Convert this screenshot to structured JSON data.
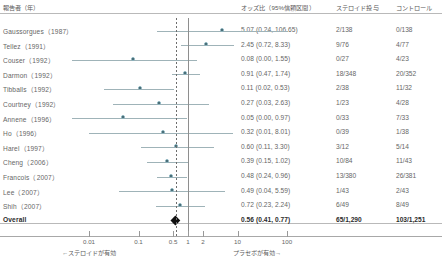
{
  "header": {
    "studies": "報告者（年）",
    "odds_ratio": "オッズ比（95%信頼区間）",
    "steroid": "ステロイド投与",
    "control": "コントロール"
  },
  "axis": {
    "ticks": [
      "0.01",
      "0.1",
      "0.5",
      "1",
      "2",
      "10",
      "100"
    ],
    "tick_values": [
      0.01,
      0.1,
      0.5,
      1,
      2,
      10,
      100
    ],
    "left_caption": "←ステロイドが有効",
    "right_caption": "プラセボが有効→",
    "null_value": 1
  },
  "colors": {
    "marker": "#2f4f57",
    "ci_line": "#9fb3b8",
    "diamond": "#111111",
    "null_line": "#8e8e8e",
    "summary_line": "#6d6d6d",
    "text": "#666666",
    "rule": "#b9b9b9"
  },
  "chart_data": {
    "type": "forest",
    "title": "",
    "xlabel": "オッズ比（95%信頼区間）",
    "ylabel": "",
    "scale": "log",
    "xlim": [
      0.004,
      300
    ],
    "grid": false,
    "null_line": 1,
    "summary_line": 0.56,
    "columns": [
      "報告者（年）",
      "オッズ比（95%信頼区間）",
      "ステロイド投与",
      "コントロール"
    ],
    "rows": [
      {
        "study": "Gaussorgues（1987）",
        "or": 5.07,
        "lo": 0.24,
        "hi": 106.65,
        "or_text": "5.07 (0.24, 106.65)",
        "steroid": "2/138",
        "control": "0/138",
        "bold": false
      },
      {
        "study": "Tellez（1991）",
        "or": 2.45,
        "lo": 0.72,
        "hi": 8.33,
        "or_text": "2.45 (0.72, 8.33)",
        "steroid": "9/76",
        "control": "4/77",
        "bold": false
      },
      {
        "study": "Couser（1992）",
        "or": 0.08,
        "lo": 0.0,
        "hi": 1.55,
        "or_text": "0.08 (0.00, 1.55)",
        "steroid": "0/27",
        "control": "4/23",
        "bold": false
      },
      {
        "study": "Darmon（1992）",
        "or": 0.91,
        "lo": 0.47,
        "hi": 1.74,
        "or_text": "0.91 (0.47, 1.74)",
        "steroid": "18/348",
        "control": "20/352",
        "bold": false
      },
      {
        "study": "Tibballs（1992）",
        "or": 0.11,
        "lo": 0.02,
        "hi": 0.53,
        "or_text": "0.11 (0.02, 0.53)",
        "steroid": "2/38",
        "control": "11/32",
        "bold": false
      },
      {
        "study": "Courtney（1992）",
        "or": 0.27,
        "lo": 0.03,
        "hi": 2.63,
        "or_text": "0.27 (0.03, 2.63)",
        "steroid": "1/23",
        "control": "4/28",
        "bold": false
      },
      {
        "study": "Annene（1996）",
        "or": 0.05,
        "lo": 0.0,
        "hi": 0.97,
        "or_text": "0.05 (0.00, 0.97)",
        "steroid": "0/33",
        "control": "7/33",
        "bold": false
      },
      {
        "study": "Ho（1996）",
        "or": 0.32,
        "lo": 0.01,
        "hi": 8.01,
        "or_text": "0.32 (0.01, 8.01)",
        "steroid": "0/39",
        "control": "1/38",
        "bold": false
      },
      {
        "study": "Harel（1997）",
        "or": 0.6,
        "lo": 0.11,
        "hi": 3.3,
        "or_text": "0.60 (0.11, 3.30)",
        "steroid": "3/12",
        "control": "5/14",
        "bold": false
      },
      {
        "study": "Cheng（2006）",
        "or": 0.39,
        "lo": 0.15,
        "hi": 1.02,
        "or_text": "0.39 (0.15, 1.02)",
        "steroid": "10/84",
        "control": "11/43",
        "bold": false
      },
      {
        "study": "Francois（2007）",
        "or": 0.48,
        "lo": 0.24,
        "hi": 0.96,
        "or_text": "0.48 (0.24, 0.96)",
        "steroid": "13/380",
        "control": "26/381",
        "bold": false
      },
      {
        "study": "Lee（2007）",
        "or": 0.49,
        "lo": 0.04,
        "hi": 5.59,
        "or_text": "0.49 (0.04, 5.59)",
        "steroid": "1/43",
        "control": "2/43",
        "bold": false
      },
      {
        "study": "Shih（2007）",
        "or": 0.72,
        "lo": 0.23,
        "hi": 2.24,
        "or_text": "0.72 (0.23, 2.24)",
        "steroid": "6/49",
        "control": "8/49",
        "bold": false
      },
      {
        "study": "Overall",
        "or": 0.56,
        "lo": 0.41,
        "hi": 0.77,
        "or_text": "0.56 (0.41, 0.77)",
        "steroid": "65/1,290",
        "control": "103/1,251",
        "bold": true,
        "summary": true
      }
    ]
  }
}
